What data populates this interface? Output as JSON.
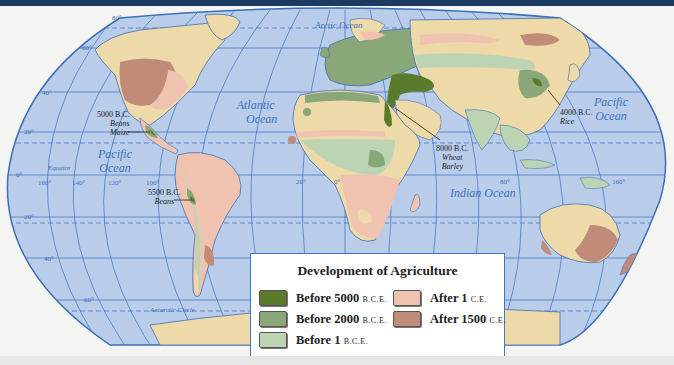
{
  "map": {
    "title": "Development of Agriculture",
    "colors": {
      "ocean": "#b9cdeb",
      "grid": "#4a79c4",
      "land": "#eed9a8",
      "coast": "#3d6fb5",
      "background": "#f4f4f2",
      "header_bar": "#1d3a63"
    },
    "oceans": [
      {
        "name": "Arctic Ocean"
      },
      {
        "name": "Atlantic",
        "name2": "Ocean"
      },
      {
        "name": "Pacific",
        "name2": "Ocean",
        "side": "west"
      },
      {
        "name": "Pacific",
        "name2": "Ocean",
        "side": "east"
      },
      {
        "name": "Indian Ocean"
      }
    ],
    "lines": {
      "equator": "Equator",
      "antarctic_circle": "Antarctic Circle"
    },
    "latitude_labels": [
      "80°",
      "60°",
      "40°",
      "20°",
      "0°",
      "20°",
      "40°",
      "60°"
    ],
    "longitude_labels": [
      "160°",
      "140°",
      "120°",
      "100°",
      "20°",
      "0°",
      "80°",
      "160°"
    ],
    "annotations": [
      {
        "date": "5000 B.C.",
        "crops": [
          "Beans",
          "Maize"
        ],
        "region": "Mesoamerica"
      },
      {
        "date": "5500 B.C.",
        "crops": [
          "Beans"
        ],
        "region": "Andes"
      },
      {
        "date": "8000 B.C.",
        "crops": [
          "Wheat",
          "Barley"
        ],
        "region": "Fertile Crescent"
      },
      {
        "date": "4000 B.C.",
        "crops": [
          "Rice"
        ],
        "region": "East Asia"
      }
    ]
  },
  "legend": {
    "title": "Development of Agriculture",
    "items": [
      {
        "label": "Before 5000",
        "era": "B.C.E.",
        "color": "#5a7a2c"
      },
      {
        "label": "Before 2000",
        "era": "B.C.E.",
        "color": "#8aa77a"
      },
      {
        "label": "Before 1",
        "era": "B.C.E.",
        "color": "#bcd3b4"
      },
      {
        "label": "After 1",
        "era": "C.E.",
        "color": "#f0c3b0"
      },
      {
        "label": "After 1500",
        "era": "C.E.",
        "color": "#c08b78"
      }
    ]
  }
}
